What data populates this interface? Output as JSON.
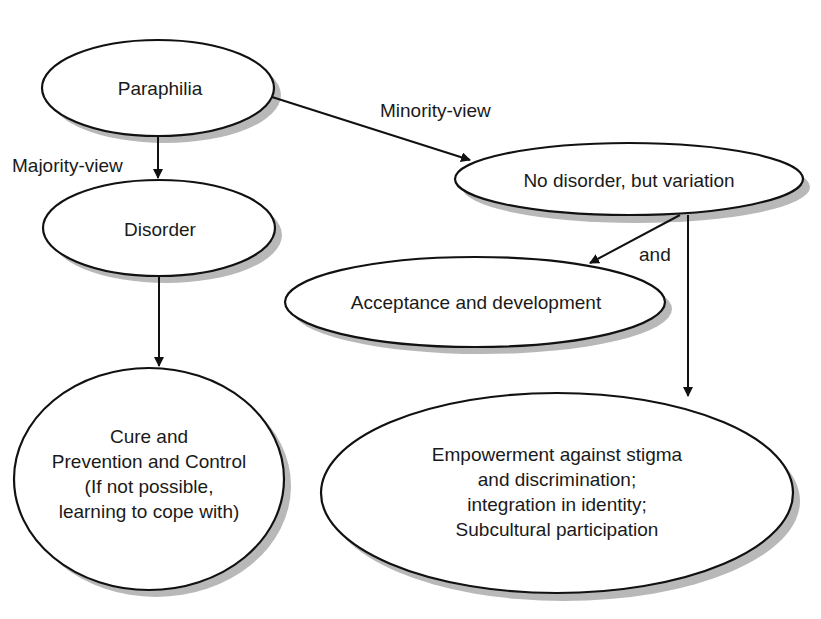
{
  "diagram": {
    "nodes": [
      {
        "id": "paraphilia",
        "text": "Paraphilia"
      },
      {
        "id": "disorder",
        "text": "Disorder"
      },
      {
        "id": "no_disorder",
        "text": "No disorder, but variation"
      },
      {
        "id": "acceptance",
        "text": "Acceptance and development"
      },
      {
        "id": "cure",
        "lines": [
          "Cure and",
          "Prevention and Control",
          "(If not possible,",
          "learning to cope with)"
        ]
      },
      {
        "id": "empowerment",
        "lines": [
          "Empowerment against stigma",
          "and discrimination;",
          "integration in identity;",
          "Subcultural participation"
        ]
      }
    ],
    "edges": [
      {
        "from": "paraphilia",
        "to": "disorder",
        "label": "Majority-view"
      },
      {
        "from": "paraphilia",
        "to": "no_disorder",
        "label": "Minority-view"
      },
      {
        "from": "no_disorder",
        "to": "acceptance",
        "label": "and"
      },
      {
        "from": "no_disorder",
        "to": "empowerment",
        "label": ""
      },
      {
        "from": "disorder",
        "to": "cure",
        "label": ""
      }
    ],
    "colors": {
      "stroke": "#111111",
      "shadow": "#b8b8b8",
      "fill": "#ffffff"
    }
  }
}
